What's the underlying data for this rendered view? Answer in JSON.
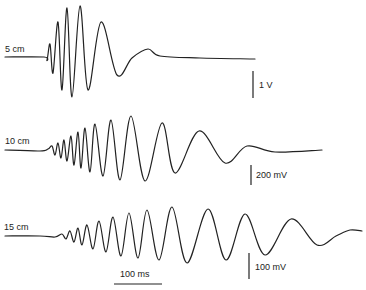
{
  "chart_data": {
    "type": "line",
    "title": "",
    "xlabel": "",
    "ylabel": "",
    "grid": false,
    "legend": "none",
    "series": [
      {
        "name": "5 cm",
        "scale_bar": "1 V",
        "description": "Short high-frequency burst then decaying low-frequency oscillation; largest amplitude, shortest duration",
        "points": [
          [
            5,
            57
          ],
          [
            44,
            57
          ],
          [
            47,
            60
          ],
          [
            50,
            44
          ],
          [
            53,
            73
          ],
          [
            58,
            22
          ],
          [
            62,
            90
          ],
          [
            67,
            8
          ],
          [
            72,
            97
          ],
          [
            80,
            6
          ],
          [
            88,
            90
          ],
          [
            101,
            22
          ],
          [
            117,
            75
          ],
          [
            132,
            58
          ],
          [
            148,
            49
          ],
          [
            160,
            56
          ],
          [
            200,
            58
          ],
          [
            255,
            59
          ]
        ]
      },
      {
        "name": "10 cm",
        "scale_bar": "200 mV",
        "description": "Longer wave train, gradually increasing period and amplitude, then decay",
        "points": [
          [
            5,
            150
          ],
          [
            40,
            151
          ],
          [
            48,
            149
          ],
          [
            52,
            146
          ],
          [
            55,
            155
          ],
          [
            58,
            143
          ],
          [
            61,
            158
          ],
          [
            64,
            140
          ],
          [
            67,
            161
          ],
          [
            71,
            136
          ],
          [
            74,
            165
          ],
          [
            78,
            132
          ],
          [
            81,
            168
          ],
          [
            85,
            128
          ],
          [
            90,
            172
          ],
          [
            95,
            124
          ],
          [
            103,
            176
          ],
          [
            111,
            120
          ],
          [
            120,
            180
          ],
          [
            131,
            116
          ],
          [
            145,
            181
          ],
          [
            162,
            123
          ],
          [
            175,
            173
          ],
          [
            199,
            131
          ],
          [
            225,
            163
          ],
          [
            247,
            146
          ],
          [
            275,
            152
          ],
          [
            322,
            150
          ]
        ]
      },
      {
        "name": "15 cm",
        "scale_bar": "100 mV",
        "description": "Longest wave train with dispersion: many low amplitude high-frequency cycles growing to larger lower-frequency cycles, then decay",
        "points": [
          [
            5,
            236
          ],
          [
            40,
            236
          ],
          [
            55,
            237
          ],
          [
            62,
            234
          ],
          [
            66,
            239
          ],
          [
            70,
            231
          ],
          [
            74,
            242
          ],
          [
            78,
            228
          ],
          [
            82,
            245
          ],
          [
            87,
            225
          ],
          [
            93,
            249
          ],
          [
            99,
            221
          ],
          [
            106,
            252
          ],
          [
            113,
            217
          ],
          [
            121,
            256
          ],
          [
            129,
            213
          ],
          [
            138,
            258
          ],
          [
            147,
            210
          ],
          [
            159,
            260
          ],
          [
            172,
            207
          ],
          [
            187,
            263
          ],
          [
            208,
            209
          ],
          [
            226,
            260
          ],
          [
            245,
            214
          ],
          [
            265,
            255
          ],
          [
            291,
            219
          ],
          [
            317,
            245
          ],
          [
            336,
            236
          ],
          [
            350,
            230
          ],
          [
            362,
            231
          ]
        ]
      }
    ],
    "annotations": {
      "time_scale": "100 ms",
      "trace_labels": [
        "5 cm",
        "10 cm",
        "15 cm"
      ],
      "voltage_scales": [
        "1 V",
        "200 mV",
        "100 mV"
      ]
    }
  },
  "labels": {
    "trace1": "5 cm",
    "trace2": "10 cm",
    "trace3": "15 cm",
    "scale1": "1 V",
    "scale2": "200 mV",
    "scale3": "100 mV",
    "time": "100 ms"
  }
}
